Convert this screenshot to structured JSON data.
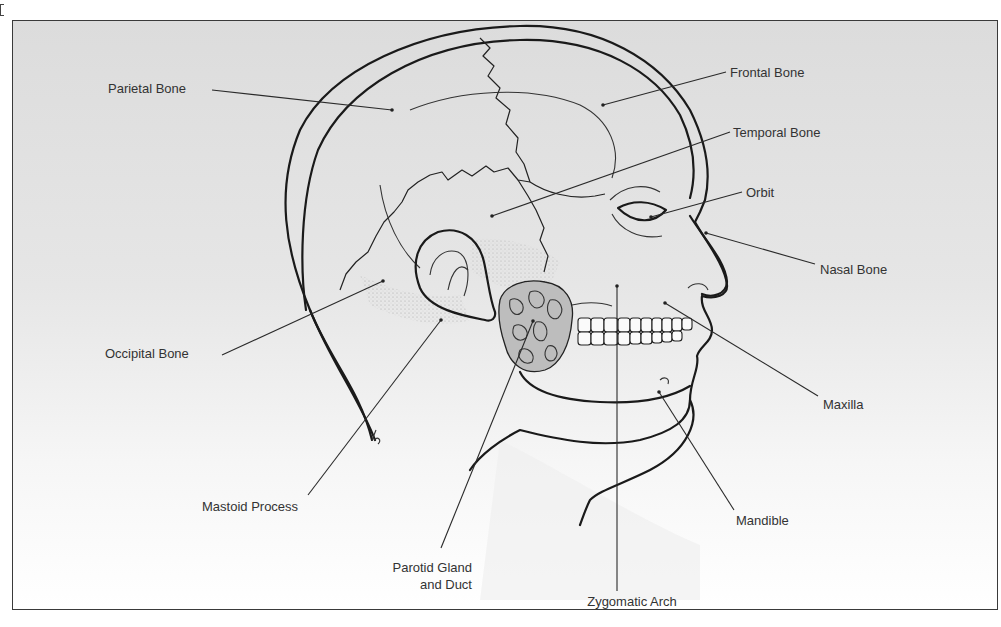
{
  "figure": {
    "colors": {
      "background_top": "#dcdcdc",
      "background_bottom": "#ffffff",
      "ink": "#1a1a1a",
      "label_text": "#333333",
      "gland_fill": "#bdbdbd",
      "skull_fill": "#f4f4f4"
    }
  },
  "labels": [
    {
      "id": "parietal-bone",
      "text": "Parietal Bone",
      "x": 108,
      "y": 93,
      "anchor": "start",
      "line": [
        212,
        90,
        392,
        110
      ]
    },
    {
      "id": "frontal-bone",
      "text": "Frontal Bone",
      "x": 730,
      "y": 77,
      "anchor": "start",
      "line": [
        726,
        72,
        603,
        105
      ]
    },
    {
      "id": "temporal-bone",
      "text": "Temporal Bone",
      "x": 733,
      "y": 137,
      "anchor": "start",
      "line": [
        730,
        132,
        492,
        216
      ]
    },
    {
      "id": "orbit",
      "text": "Orbit",
      "x": 746,
      "y": 197,
      "anchor": "start",
      "line": [
        742,
        192,
        651,
        217
      ]
    },
    {
      "id": "nasal-bone",
      "text": "Nasal Bone",
      "x": 820,
      "y": 274,
      "anchor": "start",
      "line": [
        815,
        264,
        706,
        233
      ]
    },
    {
      "id": "maxilla",
      "text": "Maxilla",
      "x": 823,
      "y": 409,
      "anchor": "start",
      "line": [
        818,
        396,
        665,
        303
      ]
    },
    {
      "id": "mandible",
      "text": "Mandible",
      "x": 736,
      "y": 525,
      "anchor": "start",
      "line": [
        734,
        510,
        659,
        392
      ]
    },
    {
      "id": "zygomatic-arch",
      "text": "Zygomatic Arch",
      "x": 632,
      "y": 606,
      "anchor": "middle",
      "line": [
        617,
        591,
        617,
        286
      ]
    },
    {
      "id": "parotid-gland-and-duct",
      "text": [
        "Parotid Gland",
        "and Duct"
      ],
      "x": 472,
      "y": 572,
      "anchor": "end",
      "line": [
        441,
        548,
        533,
        321
      ]
    },
    {
      "id": "mastoid-process",
      "text": "Mastoid Process",
      "x": 202,
      "y": 511,
      "anchor": "start",
      "line": [
        308,
        495,
        441,
        320
      ]
    },
    {
      "id": "occipital-bone",
      "text": "Occipital Bone",
      "x": 105,
      "y": 358,
      "anchor": "start",
      "line": [
        222,
        355,
        383,
        281
      ]
    }
  ]
}
